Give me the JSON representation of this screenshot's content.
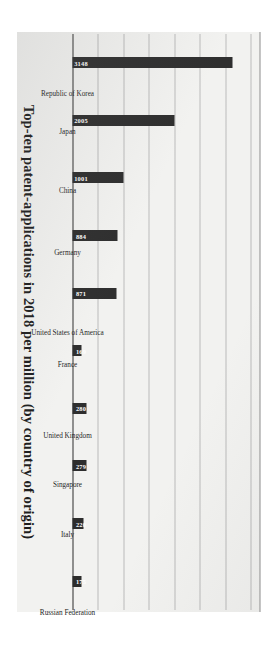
{
  "chart_data": {
    "type": "bar",
    "title": "Top-ten patent-applications in 2018 per million (by country of origin)",
    "xlabel": "",
    "ylabel": "",
    "ylim": [
      0,
      3500
    ],
    "grid": true,
    "gridline_values": [
      500,
      1000,
      1500,
      2000,
      2500,
      3000,
      3500
    ],
    "legend": "none",
    "orientation": "vertical-bars-page-rotated-90",
    "categories": [
      "Republic of Korea",
      "Japan",
      "China",
      "Germany",
      "United States of America",
      "France",
      "United Kingdom",
      "Singapore",
      "Italy",
      "Russian Federation"
    ],
    "values": [
      3148,
      2005,
      1001,
      884,
      871,
      169,
      280,
      279,
      220,
      175
    ],
    "value_labels": [
      "3148",
      "2005",
      "1001",
      "884",
      "871",
      "169",
      "280",
      "279",
      "220",
      "175"
    ],
    "bar_color": "#2b2b2b",
    "value_label_color": "#ffffff",
    "axis_color": "#2a2a2a",
    "gridline_color": "#b9b9b9",
    "paper_color": "#f2f2f0"
  }
}
